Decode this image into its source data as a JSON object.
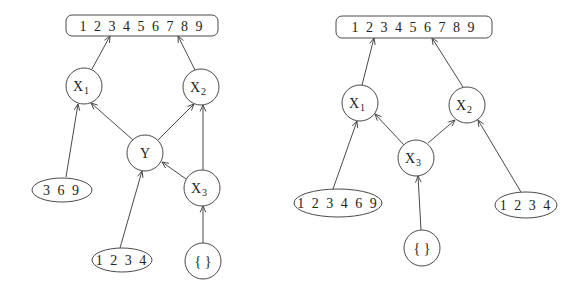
{
  "diagrams": [
    {
      "name": "left-lattice",
      "nodes": [
        {
          "id": "top",
          "shape": "rect",
          "label": "1 2 3 4 5 6 7 8 9"
        },
        {
          "id": "X1",
          "shape": "circle",
          "label": "X",
          "sub": "1"
        },
        {
          "id": "X2",
          "shape": "circle",
          "label": "X",
          "sub": "2"
        },
        {
          "id": "Y",
          "shape": "circle",
          "label": "Y",
          "sub": ""
        },
        {
          "id": "X3",
          "shape": "circle",
          "label": "X",
          "sub": "3"
        },
        {
          "id": "s369",
          "shape": "ellipse",
          "label": "3 6 9"
        },
        {
          "id": "s1234",
          "shape": "ellipse",
          "label": "1 2 3 4"
        },
        {
          "id": "empty",
          "shape": "circle",
          "label": "{ }",
          "sub": ""
        }
      ],
      "edges": [
        {
          "from": "X1",
          "to": "top"
        },
        {
          "from": "X2",
          "to": "top"
        },
        {
          "from": "s369",
          "to": "X1"
        },
        {
          "from": "Y",
          "to": "X1"
        },
        {
          "from": "Y",
          "to": "X2"
        },
        {
          "from": "X3",
          "to": "X2"
        },
        {
          "from": "X3",
          "to": "Y"
        },
        {
          "from": "s1234",
          "to": "Y"
        },
        {
          "from": "empty",
          "to": "X3"
        }
      ]
    },
    {
      "name": "right-lattice",
      "nodes": [
        {
          "id": "top",
          "shape": "rect",
          "label": "1 2 3 4 5 6 7 8 9"
        },
        {
          "id": "X1",
          "shape": "circle",
          "label": "X",
          "sub": "1"
        },
        {
          "id": "X2",
          "shape": "circle",
          "label": "X",
          "sub": "2"
        },
        {
          "id": "X3",
          "shape": "circle",
          "label": "X",
          "sub": "3"
        },
        {
          "id": "s123469",
          "shape": "ellipse",
          "label": "1 2 3 4 6 9"
        },
        {
          "id": "s1234",
          "shape": "ellipse",
          "label": "1 2 3 4"
        },
        {
          "id": "empty",
          "shape": "circle",
          "label": "{ }",
          "sub": ""
        }
      ],
      "edges": [
        {
          "from": "X1",
          "to": "top"
        },
        {
          "from": "X2",
          "to": "top"
        },
        {
          "from": "s123469",
          "to": "X1"
        },
        {
          "from": "X3",
          "to": "X1"
        },
        {
          "from": "X3",
          "to": "X2"
        },
        {
          "from": "s1234",
          "to": "X2"
        },
        {
          "from": "empty",
          "to": "X3"
        }
      ]
    }
  ]
}
